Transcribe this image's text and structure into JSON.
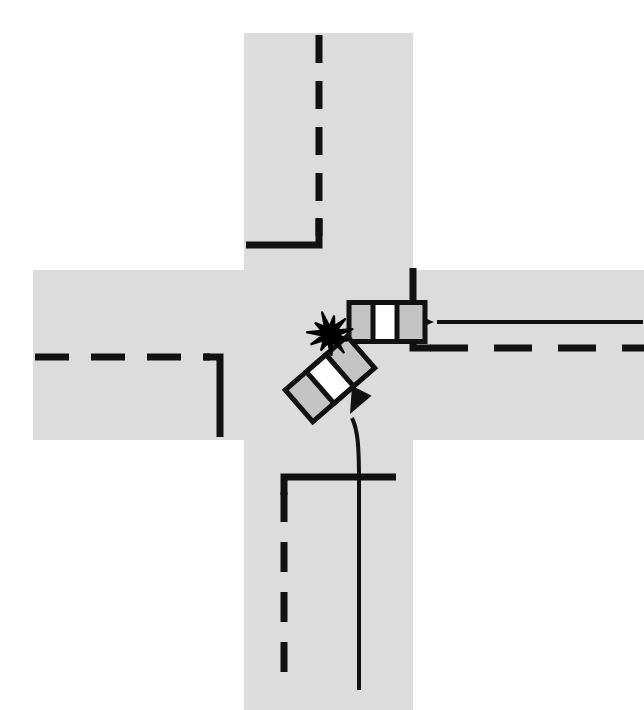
{
  "figure": {
    "kind": "traffic-collision-diagram",
    "canvas": {
      "width": 644,
      "height": 710
    },
    "background_color": "#ffffff"
  },
  "colors": {
    "road_fill": "#dcdcdc",
    "marking_stroke": "#111111",
    "vehicle_body_fill": "#c4c4c4",
    "vehicle_window_fill": "#ffffff",
    "vehicle_outline": "#111111",
    "impact_burst_fill": "#000000",
    "trajectory_stroke": "#111111",
    "page_background": "#ffffff"
  },
  "roads": {
    "vertical": {
      "name": "north-south-road",
      "x": 244,
      "width": 169,
      "y": 33,
      "height": 677,
      "label": "North-south roadway"
    },
    "horizontal": {
      "name": "east-west-road",
      "x": 33,
      "width": 611,
      "y": 270,
      "height": 170,
      "label": "East-west roadway"
    }
  },
  "markings": {
    "north_centerline": {
      "name": "north-approach-centerline",
      "x": 319,
      "dash_pattern": "28 18",
      "stroke_width": 7,
      "from_y": 35,
      "to_y": 236
    },
    "north_stopline": {
      "name": "north-approach-stop-line",
      "corner_x": 319,
      "corner_y": 245,
      "left_x": 246,
      "top_y": 218,
      "stroke_width": 7
    },
    "south_centerline": {
      "name": "south-approach-centerline",
      "x": 284,
      "dash_pattern": "30 20",
      "stroke_width": 7,
      "from_y": 492,
      "to_y": 690
    },
    "south_stopline": {
      "name": "south-approach-stop-line",
      "corner_x": 284,
      "corner_y": 477,
      "right_x": 396,
      "stroke_width": 7
    },
    "west_centerline": {
      "name": "west-approach-centerline",
      "y": 357,
      "dash_pattern": "34 22",
      "stroke_width": 7,
      "from_x": 35,
      "to_x": 210
    },
    "west_stopline": {
      "name": "west-approach-stop-line",
      "corner_x": 220,
      "corner_y": 357,
      "bottom_y": 437,
      "stroke_width": 7
    },
    "east_centerline": {
      "name": "east-approach-centerline",
      "y": 348,
      "dash_pattern": "38 26",
      "stroke_width": 7,
      "from_x": 430,
      "to_x": 644
    },
    "east_stopline": {
      "name": "east-approach-stop-line",
      "corner_x": 413,
      "corner_y": 348,
      "top_y": 268,
      "stroke_width": 7
    }
  },
  "vehicles": [
    {
      "id": "vehicle-1",
      "name": "westbound-vehicle",
      "description": "Vehicle travelling west on the east-west road",
      "center_x": 387,
      "center_y": 322,
      "length": 76,
      "width": 39,
      "rotation_deg": 0,
      "direction": "westbound",
      "window_offset": -2,
      "window_width": 24
    },
    {
      "id": "vehicle-2",
      "name": "northbound-turning-vehicle",
      "description": "Vehicle from the south approach turning into the intersection",
      "center_x": 330,
      "center_y": 379,
      "length": 82,
      "width": 42,
      "rotation_deg": -41,
      "direction": "northbound-left-turn",
      "window_offset": 0,
      "window_width": 26
    }
  ],
  "impact": {
    "name": "point-of-impact-burst",
    "center_x": 330,
    "center_y": 334,
    "outer_radius": 22,
    "inner_radius": 9,
    "points": 11
  },
  "trajectories": [
    {
      "id": "trajectory-1",
      "name": "westbound-vehicle-path",
      "description": "Straight path approaching from the east, arrow pointing west into the vehicle",
      "path": "M 643 322 L 437 322",
      "arrow_at": "end",
      "arrow_angle_deg": 180,
      "arrow_x": 434,
      "arrow_y": 322,
      "stroke_width": 4
    },
    {
      "id": "trajectory-2",
      "name": "turning-vehicle-path",
      "description": "Curved path from the south approach turning up-left toward the point of impact",
      "path": "M 359 690 L 359 480 C 359 448 358 430 352 418",
      "arrow_at": "end",
      "arrow_angle_deg": -63,
      "arrow_x": 350,
      "arrow_y": 414,
      "stroke_width": 4
    }
  ]
}
